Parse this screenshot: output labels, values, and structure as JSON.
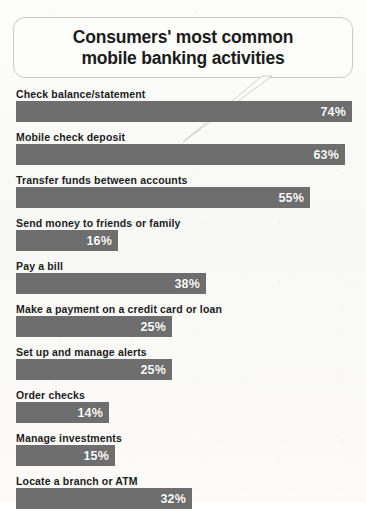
{
  "title": {
    "line1": "Consumers' most common",
    "line2": "mobile banking activities"
  },
  "colors": {
    "bar": "#6e6e6e",
    "value_text": "#ffffff",
    "label_text": "#1c1c1c",
    "bubble_border": "#c9c9c7",
    "background": "#fbfbfa"
  },
  "chart_data": {
    "type": "bar",
    "orientation": "horizontal",
    "title": "Consumers' most common mobile banking activities",
    "xlabel": "",
    "ylabel": "",
    "xlim": [
      0,
      80
    ],
    "grid": false,
    "legend": false,
    "value_suffix": "%",
    "categories": [
      "Check balance/statement",
      "Mobile check deposit",
      "Transfer funds between accounts",
      "Send money to friends or family",
      "Pay a bill",
      "Make a payment on a credit card or loan",
      "Set up and manage alerts",
      "Order checks",
      "Manage investments",
      "Locate a branch or ATM"
    ],
    "values": [
      74,
      63,
      55,
      16,
      38,
      25,
      25,
      14,
      15,
      32
    ],
    "value_labels": [
      "74%",
      "63%",
      "55%",
      "16%",
      "38%",
      "25%",
      "25%",
      "14%",
      "15%",
      "32%"
    ],
    "bar_pixel_widths": [
      336,
      329,
      294,
      102,
      190,
      156,
      156,
      93,
      99,
      176
    ]
  }
}
